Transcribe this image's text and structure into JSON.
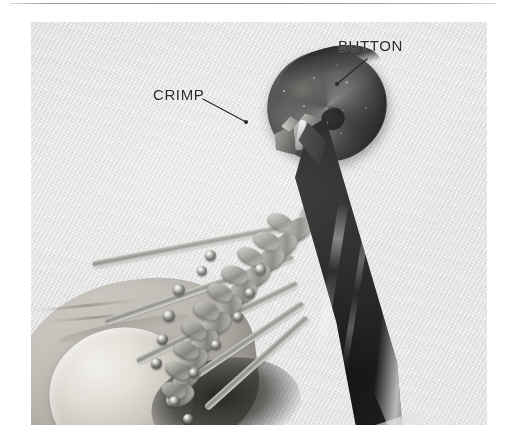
{
  "page": {
    "kind": "instructional-photo-figure"
  },
  "rule": {
    "name": "top-divider"
  },
  "photo": {
    "alt_description": "Close-up black and white photo of a hand holding a braided paracord bracelet while pliers grip a metal crimp beneath a round metal button.",
    "background_color": "#e8e8e8",
    "objects": [
      {
        "name": "button",
        "description": "round dark metal disc"
      },
      {
        "name": "crimp",
        "description": "small metal clamp sleeve"
      },
      {
        "name": "pliers",
        "description": "dark tapered needle-nose pliers"
      },
      {
        "name": "braid",
        "description": "braided paracord with beads"
      },
      {
        "name": "thumb",
        "description": "thumb holding the braid"
      },
      {
        "name": "cord-strands",
        "description": "loose cord ends fanning left"
      }
    ]
  },
  "annotations": [
    {
      "id": "button",
      "label": "BUTTON",
      "color": "#2b2b2b",
      "leader": {
        "from_x": 367,
        "from_y": 59,
        "to_x": 337,
        "to_y": 84
      }
    },
    {
      "id": "crimp",
      "label": "CRIMP",
      "color": "#2b2b2b",
      "leader": {
        "from_x": 203,
        "from_y": 99,
        "to_x": 246,
        "to_y": 122
      }
    }
  ]
}
